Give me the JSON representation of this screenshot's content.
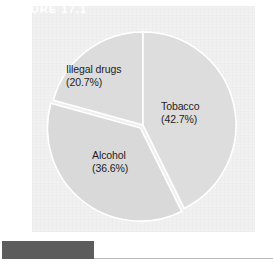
{
  "figure": {
    "caption_label": "FIGURE 17.1",
    "panel_color": "#f1f1f1",
    "caption_bar_color": "#5c5c5c",
    "caption_text_color": "#ffffff",
    "rule_color": "#b9b9b9",
    "page_background": "#ffffff"
  },
  "chart_data": {
    "type": "pie",
    "title": "",
    "subtitle": "",
    "xlabel": "",
    "ylabel": "",
    "legend_position": "none",
    "grid": false,
    "labels_inside": true,
    "start_angle_deg": 0,
    "direction": "clockwise",
    "categories": [
      "Tobacco",
      "Alcohol",
      "Illegal drugs"
    ],
    "values": [
      42.7,
      36.6,
      20.7
    ],
    "value_unit": "%",
    "slices": [
      {
        "name": "Tobacco",
        "value": 42.7,
        "label_name": "Tobacco",
        "label_pct": "(42.7%)",
        "color": "#dddddd",
        "start_angle_deg": 0,
        "end_angle_deg": 153.7,
        "exploded": false
      },
      {
        "name": "Alcohol",
        "value": 36.6,
        "label_name": "Alcohol",
        "label_pct": "(36.6%)",
        "color": "#d9d9d9",
        "start_angle_deg": 153.7,
        "end_angle_deg": 285.5,
        "exploded": true
      },
      {
        "name": "Illegal drugs",
        "value": 20.7,
        "label_name": "Illegal drugs",
        "label_pct": "(20.7%)",
        "color": "#dcdcdc",
        "start_angle_deg": 285.5,
        "end_angle_deg": 360,
        "exploded": false
      }
    ],
    "total": 100.0,
    "separator_color": "#ffffff"
  }
}
